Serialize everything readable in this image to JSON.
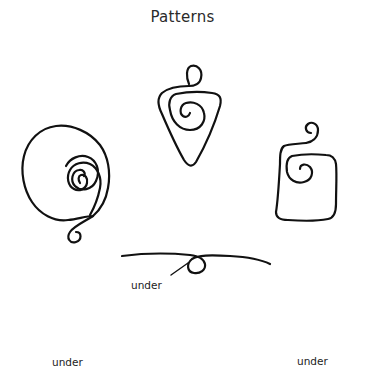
{
  "title": "Patterns",
  "colors": {
    "background": "#ffffff",
    "stroke": "#111111",
    "text": "#2a2a2a"
  },
  "patterns": [
    {
      "id": "spiral-triangle",
      "shape": "triangle with inner spiral and top loop"
    },
    {
      "id": "spiral-circle",
      "shape": "circle with inner spiral and bottom curl"
    },
    {
      "id": "spiral-square",
      "shape": "square with inner spiral and top curl"
    }
  ],
  "wraps": [
    {
      "id": "wrap-center",
      "label": "under"
    },
    {
      "id": "wrap-left",
      "label": "under"
    },
    {
      "id": "wrap-right",
      "label": "under"
    }
  ]
}
